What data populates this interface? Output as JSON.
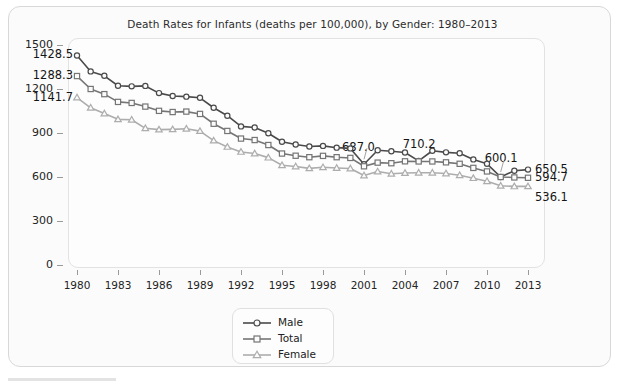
{
  "chart_data": {
    "type": "line",
    "title": "Death Rates for Infants (deaths per 100,000), by Gender: 1980–2013",
    "xlabel": "",
    "ylabel": "Rate (per 100, 000)",
    "ylim": [
      0,
      1500
    ],
    "xlim": [
      1980,
      2013
    ],
    "grid": false,
    "legend_position": "bottom-center",
    "y_ticks": [
      "0",
      "300",
      "600",
      "900",
      "1200",
      "1500"
    ],
    "y_tick_values": [
      0,
      300,
      600,
      900,
      1200,
      1500
    ],
    "x_ticks": [
      "1980",
      "1983",
      "1986",
      "1989",
      "1992",
      "1995",
      "1998",
      "2001",
      "2004",
      "2007",
      "2010",
      "2013"
    ],
    "x_tick_values": [
      1980,
      1983,
      1986,
      1989,
      1992,
      1995,
      1998,
      2001,
      2004,
      2007,
      2010,
      2013
    ],
    "x": [
      1980,
      1981,
      1982,
      1983,
      1984,
      1985,
      1986,
      1987,
      1988,
      1989,
      1990,
      1991,
      1992,
      1993,
      1994,
      1995,
      1996,
      1997,
      1998,
      1999,
      2000,
      2001,
      2002,
      2003,
      2004,
      2005,
      2006,
      2007,
      2008,
      2009,
      2010,
      2011,
      2012,
      2013
    ],
    "series": [
      {
        "name": "Male",
        "marker": "circle",
        "color": "#4a4a4a",
        "values": [
          1428.5,
          1320.0,
          1290.0,
          1222.0,
          1218.0,
          1221.0,
          1172.0,
          1152.0,
          1148.0,
          1140.0,
          1072.0,
          1018.0,
          945.0,
          937.0,
          898.0,
          840.0,
          822.0,
          808.0,
          812.0,
          800.0,
          795.0,
          687.0,
          782.0,
          776.0,
          767.0,
          710.2,
          779.0,
          768.0,
          762.0,
          720.0,
          690.0,
          600.1,
          643.0,
          650.5
        ]
      },
      {
        "name": "Total",
        "marker": "square",
        "color": "#757575",
        "values": [
          1288.3,
          1200.0,
          1165.0,
          1112.0,
          1105.0,
          1080.0,
          1051.0,
          1043.0,
          1046.0,
          1030.0,
          963.0,
          914.0,
          862.0,
          852.0,
          818.0,
          760.0,
          745.0,
          735.0,
          744.0,
          735.0,
          730.0,
          673.0,
          698.0,
          694.0,
          707.0,
          706.0,
          706.0,
          700.0,
          690.0,
          662.0,
          638.0,
          600.0,
          597.0,
          594.7
        ]
      },
      {
        "name": "Female",
        "marker": "triangle",
        "color": "#adadad",
        "values": [
          1141.7,
          1072.0,
          1033.0,
          993.0,
          990.0,
          932.0,
          923.0,
          925.0,
          929.0,
          913.0,
          848.0,
          805.0,
          771.0,
          760.0,
          732.0,
          680.0,
          672.0,
          659.0,
          666.0,
          661.0,
          658.0,
          610.0,
          637.0,
          622.0,
          627.0,
          629.0,
          629.0,
          624.0,
          612.0,
          592.0,
          571.0,
          540.0,
          536.0,
          536.1
        ]
      }
    ],
    "annotations": [
      {
        "text": "1428.5",
        "year": 1980,
        "series": "Male",
        "side": "left",
        "leader": false
      },
      {
        "text": "1288.3",
        "year": 1980,
        "series": "Total",
        "side": "left",
        "leader": false
      },
      {
        "text": "1141.7",
        "year": 1980,
        "series": "Female",
        "side": "left",
        "leader": false
      },
      {
        "text": "687.0",
        "year": 2001,
        "series": "Male",
        "side": "above",
        "leader": true
      },
      {
        "text": "710.2",
        "year": 2005,
        "series": "Male",
        "side": "above",
        "leader": false
      },
      {
        "text": "600.1",
        "year": 2011,
        "series": "Male",
        "side": "above",
        "leader": true
      },
      {
        "text": "650.5",
        "year": 2013,
        "series": "Male",
        "side": "right",
        "leader": false
      },
      {
        "text": "594.7",
        "year": 2013,
        "series": "Total",
        "side": "right",
        "leader": false
      },
      {
        "text": "536.1",
        "year": 2013,
        "series": "Female",
        "side": "right",
        "leader": false
      }
    ],
    "legend": [
      {
        "label": "Male",
        "marker": "circle",
        "color": "#4a4a4a"
      },
      {
        "label": "Total",
        "marker": "square",
        "color": "#757575"
      },
      {
        "label": "Female",
        "marker": "triangle",
        "color": "#adadad"
      }
    ]
  }
}
